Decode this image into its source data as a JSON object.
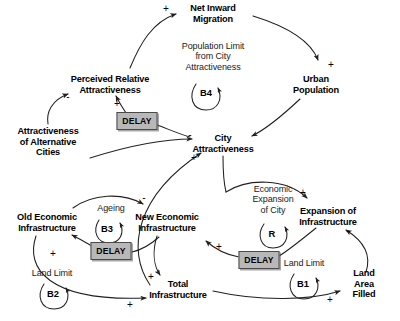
{
  "diagram": {
    "type": "causal-loop-diagram",
    "background_color": "#ffffff",
    "line_color": "#231f20",
    "delay_fill_color": "#b8b8b8",
    "delay_border_color": "#4a4a4a",
    "caption": "",
    "nodes": [
      {
        "id": "net_inward_migration",
        "label": "Net Inward\nMigration",
        "x": 213,
        "y": 13,
        "kind": "variable"
      },
      {
        "id": "urban_population",
        "label": "Urban\nPopulation",
        "x": 316,
        "y": 84,
        "kind": "variable"
      },
      {
        "id": "perceived_relative_attractiveness",
        "label": "Perceived Relative\nAttractiveness",
        "x": 110,
        "y": 84,
        "kind": "variable"
      },
      {
        "id": "attractiveness_alternative_cities",
        "label": "Attractiveness\nof Alternative\nCities",
        "x": 48,
        "y": 142,
        "kind": "variable"
      },
      {
        "id": "city_attractiveness",
        "label": "City\nAttractiveness",
        "x": 223,
        "y": 143,
        "kind": "variable"
      },
      {
        "id": "old_economic_infrastructure",
        "label": "Old Economic\nInfrastructure",
        "x": 47,
        "y": 222,
        "kind": "variable"
      },
      {
        "id": "new_economic_infrastructure",
        "label": "New Economic\nInfrastructure",
        "x": 167,
        "y": 222,
        "kind": "variable"
      },
      {
        "id": "expansion_of_infrastructure",
        "label": "Expansion of\nInfrastructure",
        "x": 328,
        "y": 216,
        "kind": "variable"
      },
      {
        "id": "total_infrastructure",
        "label": "Total\nInfrastructure",
        "x": 178,
        "y": 289,
        "kind": "variable"
      },
      {
        "id": "land_area_filled",
        "label": "Land Area\nFilled",
        "x": 364,
        "y": 284,
        "kind": "variable"
      }
    ],
    "notes": [
      {
        "id": "population_limit_note",
        "label": "Population Limit\nfrom City\nAttractiveness",
        "x": 213,
        "y": 56
      },
      {
        "id": "ageing_note",
        "label": "Ageing",
        "x": 111,
        "y": 208
      },
      {
        "id": "economic_expansion_note",
        "label": "Economic\nExpansion\nof City",
        "x": 273,
        "y": 199
      },
      {
        "id": "land_limit_b2_note",
        "label": "Land Limit",
        "x": 52,
        "y": 273
      },
      {
        "id": "land_limit_b1_note",
        "label": "Land Limit",
        "x": 304,
        "y": 263
      }
    ],
    "loops": [
      {
        "id": "B4",
        "label": "B4",
        "x": 206,
        "y": 92,
        "polarity": "balancing"
      },
      {
        "id": "B3",
        "label": "B3",
        "x": 107,
        "y": 228,
        "polarity": "balancing"
      },
      {
        "id": "B2",
        "label": "B2",
        "x": 53,
        "y": 293,
        "polarity": "balancing"
      },
      {
        "id": "B1",
        "label": "B1",
        "x": 303,
        "y": 283,
        "polarity": "balancing"
      },
      {
        "id": "R",
        "label": "R",
        "x": 272,
        "y": 233,
        "polarity": "reinforcing"
      }
    ],
    "delays": [
      {
        "id": "delay_attractiveness",
        "label": "DELAY",
        "x": 137,
        "y": 121,
        "w": 39,
        "h": 16
      },
      {
        "id": "delay_ageing",
        "label": "DELAY",
        "x": 111,
        "y": 251,
        "w": 39,
        "h": 16
      },
      {
        "id": "delay_expansion",
        "label": "DELAY",
        "x": 259,
        "y": 260,
        "w": 39,
        "h": 16
      }
    ],
    "polarities": [
      {
        "id": "p_pra_to_nim",
        "sign": "+",
        "x": 166,
        "y": 9
      },
      {
        "id": "p_nim_to_up",
        "sign": "+",
        "x": 331,
        "y": 65
      },
      {
        "id": "p_aac_to_pra",
        "sign": "-",
        "x": 68,
        "y": 97
      },
      {
        "id": "p_delay_to_pra",
        "sign": "+",
        "x": 117,
        "y": 104
      },
      {
        "id": "p_aac_to_ca",
        "sign": "-",
        "x": 190,
        "y": 135
      },
      {
        "id": "p_ti_to_ca",
        "sign": "+",
        "x": 194,
        "y": 158
      },
      {
        "id": "p_oei_to_nei",
        "sign": "-",
        "x": 144,
        "y": 198
      },
      {
        "id": "p_ca_to_eoi",
        "sign": "+",
        "x": 303,
        "y": 193
      },
      {
        "id": "p_delay_to_nei",
        "sign": "+",
        "x": 219,
        "y": 247
      },
      {
        "id": "p_delay_to_oei",
        "sign": "+",
        "x": 53,
        "y": 254
      },
      {
        "id": "p_nei_to_ti",
        "sign": "+",
        "x": 151,
        "y": 277
      },
      {
        "id": "p_oei_to_ti",
        "sign": "+",
        "x": 130,
        "y": 305
      },
      {
        "id": "p_ti_to_laf",
        "sign": "+",
        "x": 330,
        "y": 300
      },
      {
        "id": "p_laf_to_eoi",
        "sign": "-",
        "x": 348,
        "y": 231
      }
    ],
    "links": [
      {
        "from": "perceived_relative_attractiveness",
        "to": "net_inward_migration",
        "sign": "+"
      },
      {
        "from": "net_inward_migration",
        "to": "urban_population",
        "sign": "+"
      },
      {
        "from": "urban_population",
        "to": "city_attractiveness",
        "sign": "-"
      },
      {
        "from": "city_attractiveness",
        "to": "perceived_relative_attractiveness",
        "sign": "+",
        "delay": true
      },
      {
        "from": "attractiveness_alternative_cities",
        "to": "perceived_relative_attractiveness",
        "sign": "-"
      },
      {
        "from": "attractiveness_alternative_cities",
        "to": "city_attractiveness",
        "sign": "-"
      },
      {
        "from": "total_infrastructure",
        "to": "city_attractiveness",
        "sign": "+"
      },
      {
        "from": "old_economic_infrastructure",
        "to": "new_economic_infrastructure",
        "sign": "-"
      },
      {
        "from": "new_economic_infrastructure",
        "to": "old_economic_infrastructure",
        "sign": "+",
        "delay": true
      },
      {
        "from": "new_economic_infrastructure",
        "to": "total_infrastructure",
        "sign": "+"
      },
      {
        "from": "old_economic_infrastructure",
        "to": "total_infrastructure",
        "sign": "+"
      },
      {
        "from": "city_attractiveness",
        "to": "expansion_of_infrastructure",
        "sign": "+"
      },
      {
        "from": "expansion_of_infrastructure",
        "to": "new_economic_infrastructure",
        "sign": "+",
        "delay": true
      },
      {
        "from": "total_infrastructure",
        "to": "land_area_filled",
        "sign": "+"
      },
      {
        "from": "land_area_filled",
        "to": "expansion_of_infrastructure",
        "sign": "-"
      }
    ]
  }
}
